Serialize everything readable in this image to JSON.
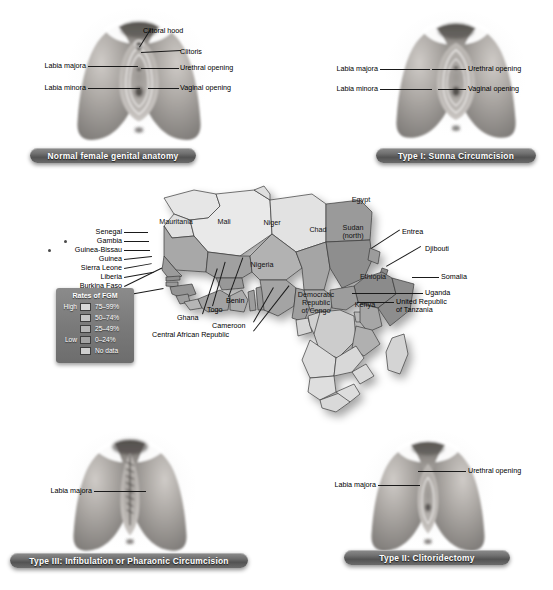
{
  "panels": [
    {
      "id": "normal",
      "caption": "Normal female genital anatomy",
      "labels_left": [
        "Labia majora",
        "Labia minora"
      ],
      "labels_right": [
        "Clitoral hood",
        "Clitoris",
        "Urethral opening",
        "Vaginal opening"
      ]
    },
    {
      "id": "type1",
      "caption": "Type I: Sunna Circumcision",
      "labels_left": [
        "Labia majora",
        "Labia minora"
      ],
      "labels_right": [
        "Urethral opening",
        "Vaginal opening"
      ]
    },
    {
      "id": "type3",
      "caption": "Type III: Infibulation or Pharaonic Circumcision",
      "labels_left": [
        "Labia majora"
      ],
      "labels_right": []
    },
    {
      "id": "type2",
      "caption": "Type II: Clitoridectomy",
      "labels_left": [
        "Labia majora"
      ],
      "labels_right": [
        "Urethral opening"
      ]
    }
  ],
  "legend": {
    "title": "Rates of FGM",
    "high_label": "High",
    "low_label": "Low",
    "items": [
      {
        "range": "75–99%",
        "color": "#d8d8d8"
      },
      {
        "range": "50–74%",
        "color": "#c6c6c6"
      },
      {
        "range": "25–49%",
        "color": "#b4b4b4"
      },
      {
        "range": "0–24%",
        "color": "#a3a3a3"
      },
      {
        "range": "No data",
        "color": "#cfcfcf"
      }
    ]
  },
  "map": {
    "inner_labels": [
      {
        "name": "Mauritania",
        "x": 56,
        "y": 62
      },
      {
        "name": "Mali",
        "x": 104,
        "y": 62
      },
      {
        "name": "Niger",
        "x": 152,
        "y": 63
      },
      {
        "name": "Chad",
        "x": 198,
        "y": 70
      },
      {
        "name": "Nigeria",
        "x": 142,
        "y": 105
      },
      {
        "name": "Egypt",
        "x": 241,
        "y": 40
      },
      {
        "name": "Sudan\n(north)",
        "x": 233,
        "y": 72
      },
      {
        "name": "Ethiopia",
        "x": 253,
        "y": 117
      },
      {
        "name": "Kenya",
        "x": 245,
        "y": 145
      },
      {
        "name": "Democratic\nRepublic\nof Congo",
        "x": 196,
        "y": 143
      }
    ],
    "left_labels": [
      "Senegal",
      "Gambia",
      "Guinea-Bissau",
      "Guinea",
      "Sierra Leone",
      "Liberia",
      "Burkina Faso",
      "Côte d'Ivoire"
    ],
    "bottom_labels": [
      "Benin",
      "Togo",
      "Ghana",
      "Cameroon",
      "Central African Republic"
    ],
    "right_labels": [
      "Entrea",
      "Djibouti",
      "Somalia",
      "Uganda",
      "United Republic\nof Tanzania"
    ]
  }
}
